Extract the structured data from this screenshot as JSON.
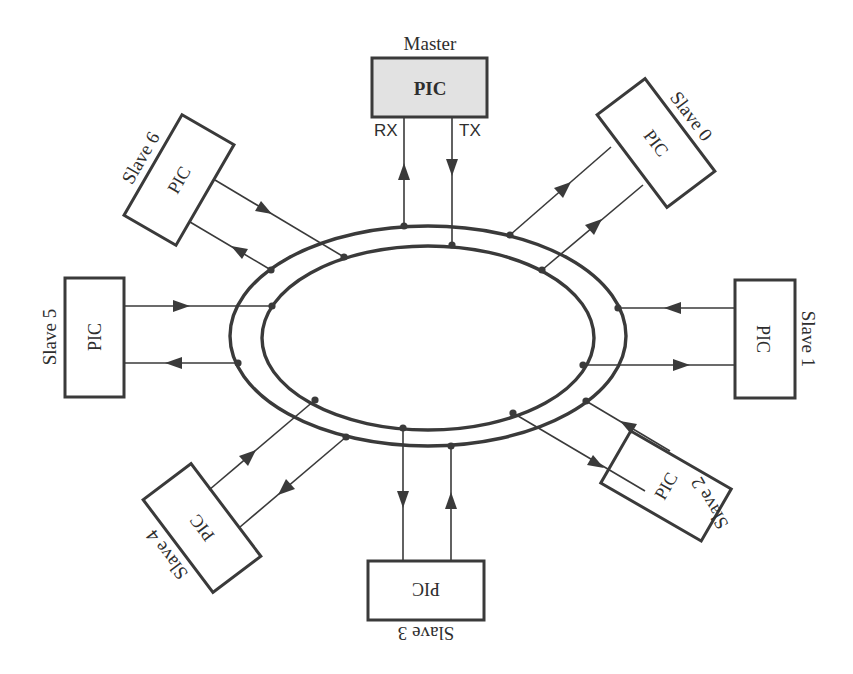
{
  "diagram": {
    "master": {
      "title": "Master",
      "chip": "PIC",
      "rx_label": "RX",
      "tx_label": "TX"
    },
    "slaves": [
      {
        "id": 0,
        "name": "Slave 0",
        "chip": "PIC"
      },
      {
        "id": 1,
        "name": "Slave 1",
        "chip": "PIC"
      },
      {
        "id": 2,
        "name": "Slave 2",
        "chip": "PIC"
      },
      {
        "id": 3,
        "name": "Slave 3",
        "chip": "PIC"
      },
      {
        "id": 4,
        "name": "Slave 4",
        "chip": "PIC"
      },
      {
        "id": 5,
        "name": "Slave 5",
        "chip": "PIC"
      },
      {
        "id": 6,
        "name": "Slave 6",
        "chip": "PIC"
      }
    ],
    "ring": {
      "outer": "outer-bus",
      "inner": "inner-bus"
    },
    "colors": {
      "stroke": "#3a3a3a",
      "master_fill": "#e2e2e2",
      "background": "#ffffff"
    }
  }
}
